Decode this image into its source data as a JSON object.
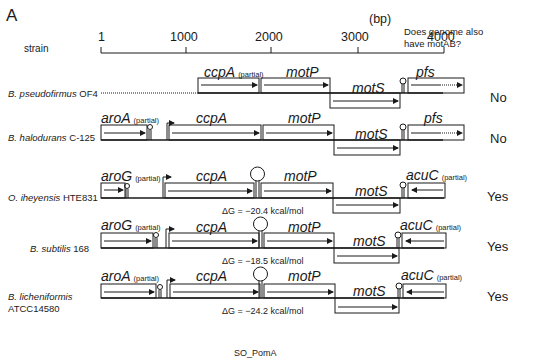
{
  "panel_label": "A",
  "header": {
    "strain_label": "strain",
    "unit_label": "(bp)",
    "question_line1": "Does genome also",
    "question_line2": "have motAB?"
  },
  "axis": {
    "ticks": [
      "1",
      "1000",
      "2000",
      "3000",
      "4000"
    ]
  },
  "rows": [
    {
      "strain_italic": "B. pseudofirmus",
      "strain_rest": "OF4",
      "answer": "No",
      "genes": [
        {
          "name": "ccpA",
          "note": "(partial)"
        },
        {
          "name": "motP",
          "note": ""
        },
        {
          "name": "motS",
          "note": ""
        },
        {
          "name": "pfs",
          "note": ""
        }
      ]
    },
    {
      "strain_italic": "B. halodurans",
      "strain_rest": "C-125",
      "answer": "No",
      "genes": [
        {
          "name": "aroA",
          "note": "(partial)"
        },
        {
          "name": "ccpA",
          "note": ""
        },
        {
          "name": "motP",
          "note": ""
        },
        {
          "name": "motS",
          "note": ""
        },
        {
          "name": "pfs",
          "note": ""
        }
      ]
    },
    {
      "strain_italic": "O. iheyensis",
      "strain_rest": "HTE831",
      "answer": "Yes",
      "delta_g": "ΔG = −20.4 kcal/mol",
      "genes": [
        {
          "name": "aroG",
          "note": "(partial)"
        },
        {
          "name": "ccpA",
          "note": ""
        },
        {
          "name": "motP",
          "note": ""
        },
        {
          "name": "motS",
          "note": ""
        },
        {
          "name": "acuC",
          "note": "(partial)"
        }
      ]
    },
    {
      "strain_italic": "B. subtilis",
      "strain_rest": "168",
      "answer": "Yes",
      "delta_g": "ΔG = −18.5 kcal/mol",
      "genes": [
        {
          "name": "aroG",
          "note": "(partial)"
        },
        {
          "name": "ccpA",
          "note": ""
        },
        {
          "name": "motP",
          "note": ""
        },
        {
          "name": "motS",
          "note": ""
        },
        {
          "name": "acuC",
          "note": "(partial)"
        }
      ]
    },
    {
      "strain_italic": "B. licheniformis",
      "strain_rest": "ATCC14580",
      "answer": "Yes",
      "delta_g": "ΔG = −24.2 kcal/mol",
      "genes": [
        {
          "name": "aroA",
          "note": "(partial)"
        },
        {
          "name": "ccpA",
          "note": ""
        },
        {
          "name": "motP",
          "note": ""
        },
        {
          "name": "motS",
          "note": ""
        },
        {
          "name": "acuC",
          "note": "(partial)"
        }
      ]
    }
  ],
  "footer_text": "SO_PomA"
}
